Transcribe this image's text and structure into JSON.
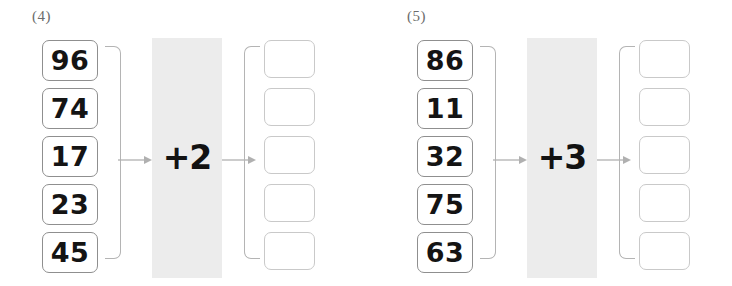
{
  "worksheet": {
    "type": "function-machine-arithmetic",
    "problems": [
      {
        "label": "(4)",
        "operator": "+2",
        "inputs": [
          "96",
          "74",
          "17",
          "23",
          "45"
        ],
        "answers": [
          "",
          "",
          "",
          "",
          ""
        ],
        "arrow_in_icon": "arrow-right-icon",
        "arrow_out_icon": "arrow-right-icon"
      },
      {
        "label": "(5)",
        "operator": "+3",
        "inputs": [
          "86",
          "11",
          "32",
          "75",
          "63"
        ],
        "answers": [
          "",
          "",
          "",
          "",
          ""
        ],
        "arrow_in_icon": "arrow-right-icon",
        "arrow_out_icon": "arrow-right-icon"
      }
    ]
  },
  "colors": {
    "page_background": "#ffffff",
    "input_box_border": "#8f8f8f",
    "answer_box_border": "#c9c9c9",
    "bracket_line": "#b4b4b4",
    "arrow_line": "#b0b0b0",
    "operator_band": "#ececec",
    "number_text": "#141414",
    "label_text": "#6b6b6b"
  }
}
